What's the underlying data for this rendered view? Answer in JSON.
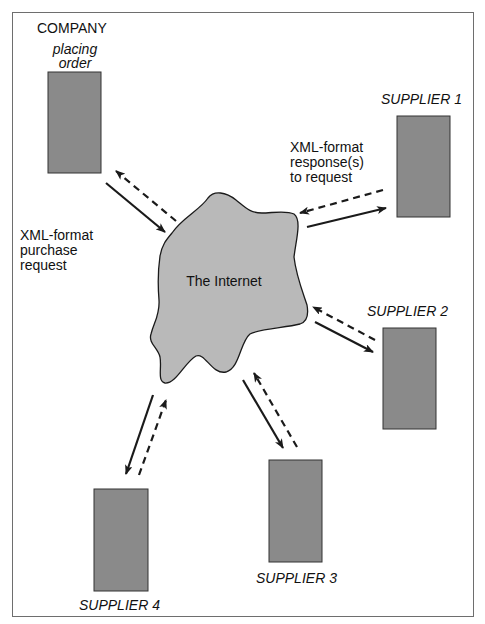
{
  "diagram": {
    "company": {
      "title": "COMPANY",
      "subtitle_line1": "placing",
      "subtitle_line2": "order"
    },
    "internet_label": "The Internet",
    "request_label": {
      "line1": "XML-format",
      "line2": "purchase",
      "line3": "request"
    },
    "response_label": {
      "line1": "XML-format",
      "line2": "response(s)",
      "line3": "to request"
    },
    "suppliers": [
      {
        "label": "SUPPLIER 1"
      },
      {
        "label": "SUPPLIER 2"
      },
      {
        "label": "SUPPLIER 3"
      },
      {
        "label": "SUPPLIER 4"
      }
    ],
    "legend": {
      "solid_arrow": "purchase request",
      "dashed_arrow": "response"
    },
    "colors": {
      "box_fill": "#8a8a8a",
      "cloud_fill": "#b9b9b9",
      "stroke": "#1a1a1a",
      "frame": "#6e6e6e"
    }
  }
}
